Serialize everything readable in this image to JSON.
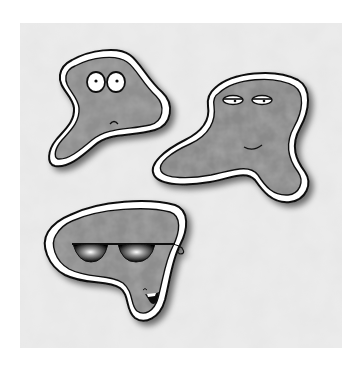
{
  "image": {
    "description": "Cartoon illustration of three grey mottled amoeba characters with white outlines on a cloudy grey textured square background",
    "background_color": "#ffffff",
    "texture_colors": [
      "#f2f2f2",
      "#d6d6d6",
      "#c8c8c8"
    ],
    "body_colors": [
      "#8c8c8c",
      "#a8a8a8",
      "#6e6e6e"
    ],
    "outline_color": "#111111",
    "rim_color": "#ffffff"
  },
  "characters": [
    {
      "name": "surprised-amoeba",
      "expression": "wide round eyes, small frown"
    },
    {
      "name": "sleepy-amoeba",
      "expression": "half-closed eyes, slight smile"
    },
    {
      "name": "cool-amoeba",
      "expression": "dark sunglasses, open grin"
    }
  ]
}
